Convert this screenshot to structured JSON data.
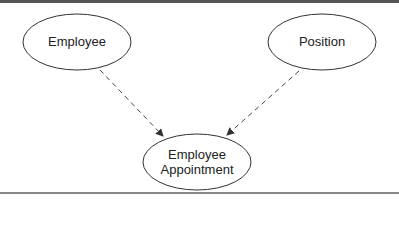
{
  "diagram": {
    "nodes": [
      {
        "id": "employee",
        "label": "Employee"
      },
      {
        "id": "position",
        "label": "Position"
      },
      {
        "id": "employee_appointment",
        "label_line1": "Employee",
        "label_line2": "Appointment"
      }
    ],
    "edges": [
      {
        "from": "employee",
        "to": "employee_appointment",
        "style": "dashed",
        "arrow": "to"
      },
      {
        "from": "position",
        "to": "employee_appointment",
        "style": "dashed",
        "arrow": "to"
      }
    ]
  }
}
